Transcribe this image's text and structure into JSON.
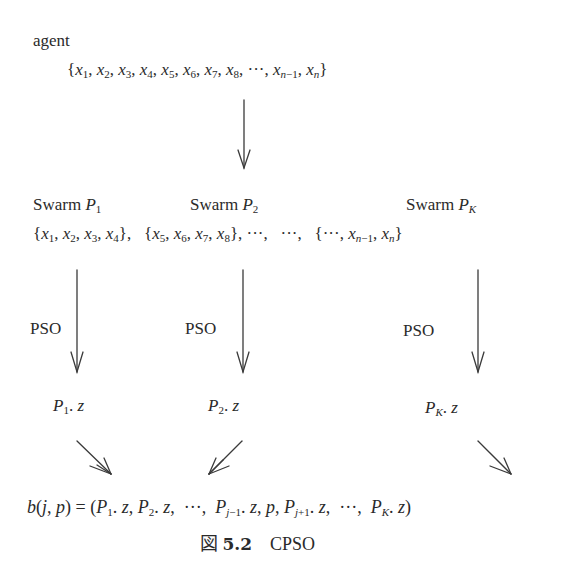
{
  "diagram": {
    "agent_label": "agent",
    "agent_vector": "{x1, x2, x3, x4, x5, x6, x7, x8, ···, xn−1, xn}",
    "swarms": [
      {
        "label": "Swarm P1",
        "name": "Swarm",
        "sym": "P",
        "sub": "1",
        "subset": "{x1, x2, x3, x4},",
        "process": "PSO",
        "result": "P1. z"
      },
      {
        "label": "Swarm P2",
        "name": "Swarm",
        "sym": "P",
        "sub": "2",
        "subset": "{x5, x6, x7, x8}, ···,  ···,",
        "process": "PSO",
        "result": "P2. z"
      },
      {
        "label": "Swarm PK",
        "name": "Swarm",
        "sym": "P",
        "sub": "K",
        "subset": "{···, xn−1, xn}",
        "process": "PSO",
        "result": "PK. z"
      }
    ],
    "ellipsis": "···",
    "context_vector": "b(j, p) = (P1. z, P2. z,  ···,  Pj−1. z, p, Pj+1. z,  ···,  PK. z)",
    "caption": {
      "prefix": "図",
      "number": "5.2",
      "title": "CPSO"
    },
    "stroke_color": "#3a3a3a"
  }
}
